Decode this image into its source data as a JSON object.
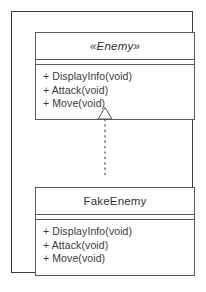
{
  "diagram": {
    "type": "uml-class-diagram",
    "relationship": {
      "kind": "realization",
      "arrowhead": "hollow-triangle",
      "line_style": "dotted",
      "from": "FakeEnemy",
      "to": "Enemy"
    },
    "classes": [
      {
        "id": "enemy",
        "name": "«Enemy»",
        "stereotype": "Enemy",
        "abstract": true,
        "methods": [
          "+ DisplayInfo(void)",
          "+ Attack(void)",
          "+ Move(void)"
        ]
      },
      {
        "id": "fake_enemy",
        "name": "FakeEnemy",
        "abstract": false,
        "methods": [
          "+ DisplayInfo(void)",
          "+ Attack(void)",
          "+ Move(void)"
        ]
      }
    ]
  },
  "colors": {
    "frame_border": "#3c3c3c",
    "class_border": "#5a5a5a",
    "text": "#3a3a3a",
    "title_text": "#333333",
    "background": "#fdfdfd",
    "class_fill": "#ffffff"
  }
}
